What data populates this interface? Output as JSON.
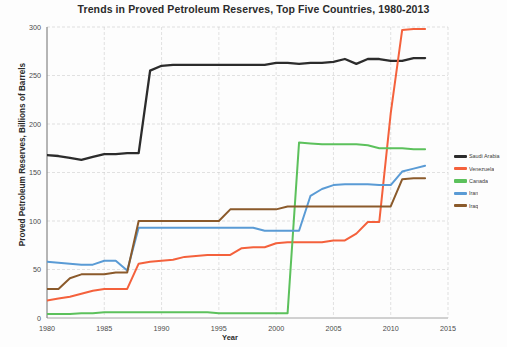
{
  "chart_data": {
    "type": "line",
    "title": "Trends in Proved Petroleum Reserves, Top Five Countries, 1980-2013",
    "xlabel": "Year",
    "ylabel": "Proved Petroleum Reserves, Billions of Barrels",
    "xlim": [
      1980,
      2015
    ],
    "ylim": [
      0,
      300
    ],
    "xticks": [
      1980,
      1985,
      1990,
      1995,
      2000,
      2005,
      2010,
      2015
    ],
    "yticks": [
      0,
      50,
      100,
      150,
      200,
      250,
      300
    ],
    "grid": true,
    "legend_position": "right",
    "x": [
      1980,
      1981,
      1982,
      1983,
      1984,
      1985,
      1986,
      1987,
      1988,
      1989,
      1990,
      1991,
      1992,
      1993,
      1994,
      1995,
      1996,
      1997,
      1998,
      1999,
      2000,
      2001,
      2002,
      2003,
      2004,
      2005,
      2006,
      2007,
      2008,
      2009,
      2010,
      2011,
      2012,
      2013
    ],
    "series": [
      {
        "name": "Saudi Arabia",
        "color": "#2c2c2c",
        "values": [
          168,
          167,
          165,
          163,
          166,
          169,
          169,
          170,
          170,
          255,
          260,
          261,
          261,
          261,
          261,
          261,
          261,
          261,
          261,
          261,
          263,
          263,
          262,
          263,
          263,
          264,
          267,
          262,
          267,
          267,
          265,
          265,
          268,
          268
        ]
      },
      {
        "name": "Venezuela",
        "color": "#f4613c",
        "values": [
          18,
          20,
          22,
          25,
          28,
          30,
          30,
          30,
          56,
          58,
          59,
          60,
          63,
          64,
          65,
          65,
          65,
          72,
          73,
          73,
          77,
          78,
          78,
          78,
          78,
          80,
          80,
          87,
          99,
          99,
          211,
          297,
          298,
          298
        ]
      },
      {
        "name": "Canada",
        "color": "#5cc15c",
        "values": [
          4,
          4,
          4,
          5,
          5,
          6,
          6,
          6,
          6,
          6,
          6,
          6,
          6,
          6,
          6,
          5,
          5,
          5,
          5,
          5,
          5,
          5,
          181,
          180,
          179,
          179,
          179,
          179,
          178,
          175,
          175,
          175,
          174,
          174
        ]
      },
      {
        "name": "Iran",
        "color": "#5a9bd5",
        "values": [
          58,
          57,
          56,
          55,
          55,
          59,
          59,
          49,
          93,
          93,
          93,
          93,
          93,
          93,
          93,
          93,
          93,
          93,
          93,
          90,
          90,
          90,
          90,
          126,
          133,
          137,
          138,
          138,
          138,
          137,
          137,
          151,
          154,
          157
        ]
      },
      {
        "name": "Iraq",
        "color": "#8b5a2b",
        "values": [
          30,
          30,
          41,
          45,
          45,
          45,
          47,
          47,
          100,
          100,
          100,
          100,
          100,
          100,
          100,
          100,
          112,
          112,
          112,
          112,
          112,
          115,
          115,
          115,
          115,
          115,
          115,
          115,
          115,
          115,
          115,
          143,
          144,
          144
        ]
      }
    ]
  },
  "legend": {
    "items": [
      {
        "label": "Saudi Arabia",
        "color": "#2c2c2c"
      },
      {
        "label": "Venezuela",
        "color": "#f4613c"
      },
      {
        "label": "Canada",
        "color": "#5cc15c"
      },
      {
        "label": "Iran",
        "color": "#5a9bd5"
      },
      {
        "label": "Iraq",
        "color": "#8b5a2b"
      }
    ]
  }
}
